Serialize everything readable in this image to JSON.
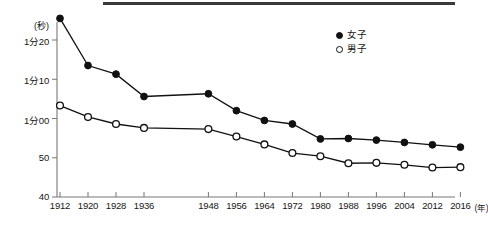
{
  "chart_data": {
    "type": "line",
    "title": "",
    "xlabel": "(年)",
    "ylabel": "(秒)",
    "grid": false,
    "legend_position": "top-right",
    "categories": [
      "1912",
      "1920",
      "1928",
      "1936",
      "1948",
      "1956",
      "1964",
      "1972",
      "1980",
      "1988",
      "1996",
      "2004",
      "2012",
      "2016"
    ],
    "x_tick_labels": [
      "1912",
      "1920",
      "1928",
      "1936",
      "1948",
      "1956",
      "1964",
      "1972",
      "1980",
      "1988",
      "1996",
      "2004",
      "2012",
      "2016"
    ],
    "x_axis_unit": "(年)",
    "y_tick_labels": [
      "1分20",
      "1分10",
      "1分00",
      "50",
      "40"
    ],
    "y_tick_values": [
      80,
      70,
      60,
      50,
      40
    ],
    "y_axis_unit": "(秒)",
    "ylim": [
      40,
      88
    ],
    "series": [
      {
        "name": "女子",
        "marker": "filled-circle",
        "color": "#111111",
        "values": [
          85.5,
          73.5,
          71.3,
          65.6,
          66.3,
          62.0,
          59.5,
          58.6,
          54.8,
          54.9,
          54.5,
          53.9,
          53.3,
          52.7
        ]
      },
      {
        "name": "男子",
        "marker": "open-circle",
        "color": "#111111",
        "values": [
          63.3,
          60.4,
          58.6,
          57.6,
          57.3,
          55.4,
          53.4,
          51.2,
          50.4,
          48.6,
          48.7,
          48.2,
          47.5,
          47.6
        ]
      }
    ]
  },
  "legend": {
    "items": [
      {
        "label": "女子",
        "marker": "filled-circle"
      },
      {
        "label": "男子",
        "marker": "open-circle"
      }
    ]
  }
}
